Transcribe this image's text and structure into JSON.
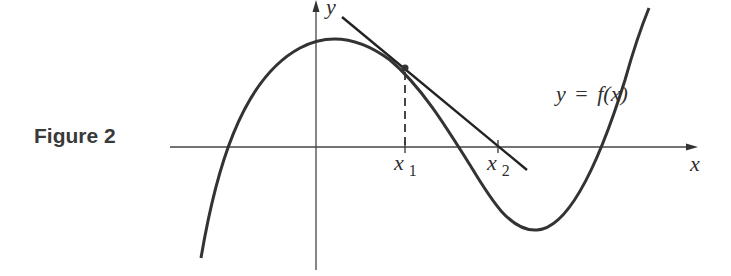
{
  "figure": {
    "caption": "Figure 2",
    "labels": {
      "y_axis": "y",
      "x_axis": "x",
      "x1": "x",
      "x1_sub": "1",
      "x2": "x",
      "x2_sub": "2",
      "curve_lhs": "y",
      "curve_eq": " = ",
      "curve_rhs": "f(x)"
    }
  },
  "colors": {
    "curve": "#333333",
    "axes": "#444444",
    "text": "#2f2f2f"
  }
}
